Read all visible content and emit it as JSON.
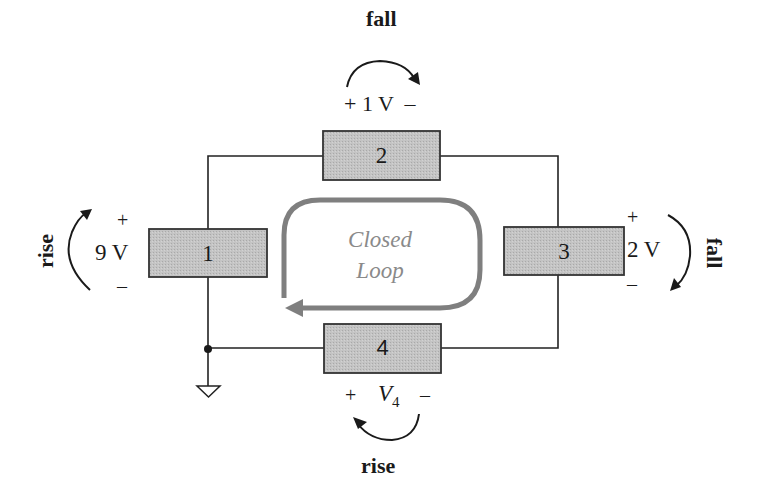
{
  "diagram": {
    "colors": {
      "wire": "#222222",
      "element_fill": "#bdbdbd",
      "element_stroke": "#333333",
      "loop_arrow": "#7f7f7f",
      "loop_text": "#8a8a8a",
      "text": "#1a1a1a"
    },
    "elements": [
      {
        "id": "1",
        "label": "1",
        "voltage": "9 V",
        "plus": "+",
        "minus": "–",
        "direction_word": "rise"
      },
      {
        "id": "2",
        "label": "2",
        "voltage": "+ 1 V  –",
        "direction_word": "fall"
      },
      {
        "id": "3",
        "label": "3",
        "voltage": "2 V",
        "plus": "+",
        "minus": "–",
        "direction_word": "fall"
      },
      {
        "id": "4",
        "label": "4",
        "voltage_symbol": "V",
        "voltage_subscript": "4",
        "plus": "+",
        "minus": "–",
        "direction_word": "rise"
      }
    ],
    "loop": {
      "line1": "Closed",
      "line2": "Loop",
      "direction": "clockwise"
    },
    "ground": "ground-symbol",
    "junction": "node-dot"
  }
}
